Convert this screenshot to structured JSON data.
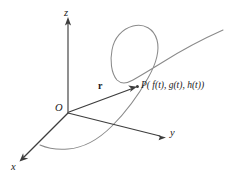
{
  "figure": {
    "background_color": "#ffffff",
    "axis_color": "#3d3d3d",
    "curve_color": "#8a8a8a",
    "vector_color": "#3d3d3d",
    "label_color": "#1a1a1a"
  },
  "axes": {
    "z": {
      "label": "z",
      "direction": "up"
    },
    "y": {
      "label": "y",
      "direction": "right"
    },
    "x": {
      "label": "x",
      "direction": "lower-left"
    }
  },
  "origin": {
    "label": "O"
  },
  "vector": {
    "label": "r",
    "style": "bold",
    "from": "O",
    "to": "P"
  },
  "point": {
    "label": "P( f(t), g(t), h(t))",
    "name": "P",
    "components": [
      "f(t)",
      "g(t)",
      "h(t)"
    ]
  },
  "curve": {
    "description": "space curve with a loop",
    "color": "#8a8a8a"
  },
  "icons": {
    "z_arrow": "arrow-up-icon",
    "y_arrow": "arrow-right-icon",
    "x_arrow": "arrow-down-left-icon",
    "vector_arrow": "arrow-vector-icon"
  }
}
